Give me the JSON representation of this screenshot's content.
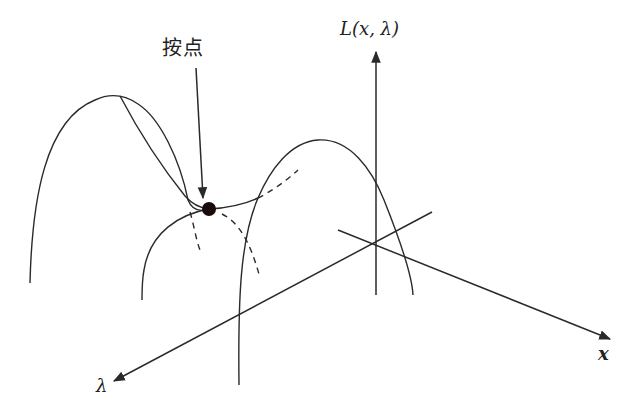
{
  "diagram": {
    "labels": {
      "saddle_point": "按点",
      "vertical_axis": "L(x, λ)",
      "lambda_axis": "λ",
      "x_axis": "x"
    },
    "colors": {
      "line": "#2a2a2a",
      "point": "#1a0a0a",
      "background": "#ffffff"
    },
    "elements": [
      {
        "id": "saddle-point",
        "type": "dot",
        "cx": 209,
        "cy": 209,
        "r": 7
      },
      {
        "id": "vertical-axis",
        "type": "arrow",
        "from": [
          376,
          295
        ],
        "to": [
          376,
          50
        ]
      },
      {
        "id": "x-axis",
        "type": "arrow",
        "from": [
          338,
          230
        ],
        "to": [
          612,
          340
        ]
      },
      {
        "id": "lambda-axis",
        "type": "arrow",
        "from": [
          432,
          212
        ],
        "to": [
          112,
          382
        ]
      },
      {
        "id": "pointer-arrow",
        "type": "arrow",
        "from": [
          196,
          68
        ],
        "to": [
          204,
          200
        ]
      }
    ]
  }
}
